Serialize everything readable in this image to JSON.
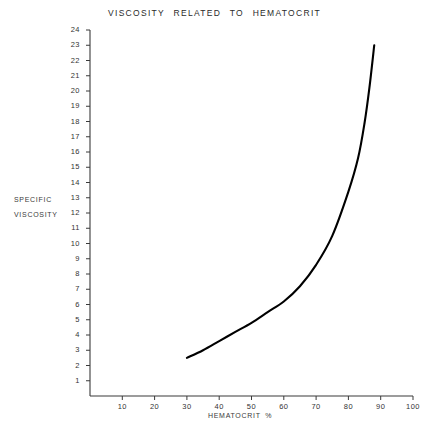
{
  "chart_data": {
    "type": "line",
    "title": "VISCOSITY   RELATED   TO   HEMATOCRIT",
    "xlabel": "HEMATOCRIT  %",
    "ylabel_lines": [
      "SPECIFIC",
      "VISCOSITY"
    ],
    "xlim": [
      0,
      100
    ],
    "ylim": [
      0,
      24
    ],
    "grid": false,
    "legend": null,
    "xticks": [
      10,
      20,
      30,
      40,
      50,
      60,
      70,
      80,
      90,
      100
    ],
    "xtick_labels": [
      "10",
      "20",
      "30",
      "40",
      "50",
      "60",
      "70",
      "80",
      "90",
      "100"
    ],
    "yticks": [
      1,
      2,
      3,
      4,
      5,
      6,
      7,
      8,
      9,
      10,
      11,
      12,
      13,
      14,
      15,
      16,
      17,
      18,
      19,
      20,
      21,
      22,
      23,
      24
    ],
    "ytick_labels": [
      "1",
      "2",
      "3",
      "4",
      "5",
      "6",
      "7",
      "8",
      "9",
      "10",
      "11",
      "12",
      "13",
      "14",
      "15",
      "16",
      "17",
      "18",
      "19",
      "20",
      "21",
      "22",
      "23",
      "24"
    ],
    "series": [
      {
        "name": "specific viscosity vs hematocrit",
        "color": "#000000",
        "x": [
          30,
          35,
          40,
          45,
          50,
          55,
          60,
          65,
          70,
          75,
          80,
          83,
          85,
          86.5,
          88
        ],
        "y": [
          2.5,
          3.0,
          3.6,
          4.2,
          4.8,
          5.5,
          6.2,
          7.2,
          8.6,
          10.5,
          13.4,
          15.6,
          17.9,
          20.2,
          23.0
        ]
      }
    ]
  }
}
